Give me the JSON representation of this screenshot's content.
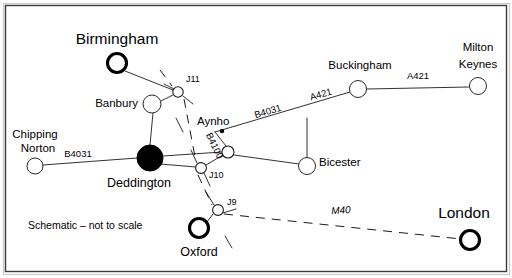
{
  "figure": {
    "caption_note": "Schematic – not to scale",
    "width": 512,
    "height": 278,
    "background_color": "#ffffff",
    "border_color": "#3a3a3a",
    "ink_color": "#1a1a1a"
  },
  "chart_data": {
    "type": "diagram",
    "title": "Schematic – not to scale",
    "subtype": "schematic-road-network-map",
    "nodes": [
      {
        "id": "birmingham",
        "label": "Birmingham",
        "kind": "city",
        "x": 117,
        "y": 63,
        "r": 9.5,
        "label_x": 117,
        "label_y": 40,
        "label_class": "label-city",
        "anchor": "middle"
      },
      {
        "id": "banbury",
        "label": "Banbury",
        "kind": "town",
        "x": 152,
        "y": 104,
        "r": 9.0,
        "label_x": 138,
        "label_y": 104,
        "label_class": "label-town",
        "anchor": "end"
      },
      {
        "id": "j11",
        "label": "J11",
        "kind": "junction",
        "x": 178,
        "y": 92,
        "r": 5.2,
        "label_x": 186,
        "label_y": 80,
        "label_class": "label-junction",
        "anchor": "start"
      },
      {
        "id": "chipping-norton",
        "label": "Chipping",
        "kind": "town",
        "x": 35,
        "y": 166,
        "r": 8.0,
        "label_x": 35,
        "label_y": 135,
        "label_class": "label-town",
        "anchor": "middle"
      },
      {
        "id": "deddington",
        "label": "Deddington",
        "kind": "hub",
        "x": 150,
        "y": 158,
        "r": 13.0,
        "label_x": 139,
        "label_y": 184,
        "label_class": "label-city-sm",
        "anchor": "middle"
      },
      {
        "id": "aynho",
        "label": "Aynho",
        "kind": "junction",
        "x": 228,
        "y": 152,
        "r": 6.0,
        "label_x": 197,
        "label_y": 122,
        "label_class": "label-town",
        "anchor": "start"
      },
      {
        "id": "j10",
        "label": "J10",
        "kind": "junction",
        "x": 201,
        "y": 168,
        "r": 5.4,
        "label_x": 209,
        "label_y": 176,
        "label_class": "label-junction",
        "anchor": "start"
      },
      {
        "id": "bicester",
        "label": "Bicester",
        "kind": "town",
        "x": 307,
        "y": 166,
        "r": 8.5,
        "label_x": 319,
        "label_y": 163,
        "label_class": "label-town",
        "anchor": "start"
      },
      {
        "id": "buckingham",
        "label": "Buckingham",
        "kind": "town",
        "x": 358,
        "y": 89,
        "r": 8.5,
        "label_x": 360,
        "label_y": 66,
        "label_class": "label-town",
        "anchor": "middle"
      },
      {
        "id": "milton-keynes",
        "label": "Milton",
        "kind": "town",
        "x": 478,
        "y": 86,
        "r": 8.5,
        "label_x": 478,
        "label_y": 48,
        "label_class": "label-town",
        "anchor": "middle"
      },
      {
        "id": "j9",
        "label": "J9",
        "kind": "junction",
        "x": 218,
        "y": 210,
        "r": 5.4,
        "label_x": 227,
        "label_y": 203,
        "label_class": "label-junction",
        "anchor": "start"
      },
      {
        "id": "oxford",
        "label": "Oxford",
        "kind": "city",
        "x": 199,
        "y": 228,
        "r": 9.5,
        "label_x": 199,
        "label_y": 253,
        "label_class": "label-city-sm",
        "anchor": "middle"
      },
      {
        "id": "london",
        "label": "London",
        "kind": "city",
        "x": 470,
        "y": 240,
        "r": 9.5,
        "label_x": 464,
        "label_y": 214,
        "label_class": "label-city",
        "anchor": "middle"
      }
    ],
    "node_extra_labels": [
      {
        "id": "chipping-norton-2",
        "label": "Norton",
        "x": 38,
        "y": 149,
        "label_class": "label-town",
        "anchor": "middle"
      },
      {
        "id": "milton-keynes-2",
        "label": "Keynes",
        "x": 478,
        "y": 65,
        "label_class": "label-town",
        "anchor": "middle"
      }
    ],
    "edges": [
      {
        "id": "birmingham-j11",
        "kind": "road",
        "points": "125,71 178,92"
      },
      {
        "id": "banbury-j11",
        "kind": "road",
        "points": "161,101 173,95"
      },
      {
        "id": "banbury-deddington",
        "kind": "road",
        "points": "153,113 150,145"
      },
      {
        "id": "chipping-deddington",
        "kind": "road",
        "points": "43,165 137,158"
      },
      {
        "id": "deddington-aynho",
        "kind": "road",
        "points": "163,156 222,152"
      },
      {
        "id": "deddington-j10",
        "kind": "road",
        "points": "160,164 196,167"
      },
      {
        "id": "aynho-j10",
        "kind": "road",
        "points": "223,155 206,165"
      },
      {
        "id": "aynho-b4031",
        "kind": "road",
        "points": "226,146 215,132"
      },
      {
        "id": "aynho-bicester",
        "kind": "road",
        "points": "234,155 299,164"
      },
      {
        "id": "b4031-a421-main",
        "kind": "road",
        "points": "215,132 350,92"
      },
      {
        "id": "a421-bicester-spur",
        "kind": "road",
        "points": "307,159 307,118"
      },
      {
        "id": "buckingham-mk",
        "kind": "road",
        "points": "367,89 469,87"
      },
      {
        "id": "j9-oxford",
        "kind": "road",
        "points": "213,214 207,222"
      }
    ],
    "motorway_segments": [
      {
        "id": "m40-north",
        "points": "160,70 172,86"
      },
      {
        "id": "m40-j11-j10",
        "points": "184,99 196,162"
      },
      {
        "id": "m40-j10-j9",
        "points": "198,175 212,205"
      },
      {
        "id": "m40-j9-london",
        "points": "224,214 461,239"
      }
    ],
    "junction_ticks": [
      {
        "id": "j11-tick-nw",
        "points": "164,84 174,89"
      },
      {
        "id": "j11-tick-se",
        "points": "183,96 193,104"
      },
      {
        "id": "j10-tick-nw",
        "points": "191,150 197,163"
      },
      {
        "id": "j10-tick-se",
        "points": "204,173 210,186"
      },
      {
        "id": "j9-tick-nw",
        "points": "206,192 214,205"
      },
      {
        "id": "j9-tick-se",
        "points": "223,213 236,209"
      },
      {
        "id": "m40-dash-a",
        "points": "176,118 183,132"
      },
      {
        "id": "m40-dash-b",
        "points": "225,236 232,248"
      }
    ],
    "arrow_markers": [
      {
        "id": "aynho-arrow-dot",
        "x": 222,
        "y": 131,
        "r": 2.2
      }
    ],
    "road_labels": [
      {
        "id": "b4031-west",
        "label": "B4031",
        "x": 78,
        "y": 154,
        "rotate": 0,
        "label_class": "label-road",
        "anchor": "middle"
      },
      {
        "id": "b4031-east",
        "label": "B4031",
        "x": 268,
        "y": 112,
        "rotate": -16,
        "label_class": "label-road",
        "anchor": "middle"
      },
      {
        "id": "b4100",
        "label": "B4100",
        "x": 214,
        "y": 146,
        "rotate": 64,
        "label_class": "label-road",
        "anchor": "middle"
      },
      {
        "id": "a421-west",
        "label": "A421",
        "x": 321,
        "y": 95,
        "rotate": -16,
        "label_class": "label-road",
        "anchor": "middle"
      },
      {
        "id": "a421-east",
        "label": "A421",
        "x": 418,
        "y": 76,
        "rotate": 0,
        "label_class": "label-road",
        "anchor": "middle"
      },
      {
        "id": "m40",
        "label": "M40",
        "x": 341,
        "y": 211,
        "rotate": -4,
        "label_class": "label-road-it",
        "anchor": "middle"
      }
    ],
    "legend_note": {
      "text": "Schematic – not to scale",
      "x": 28,
      "y": 226
    }
  }
}
